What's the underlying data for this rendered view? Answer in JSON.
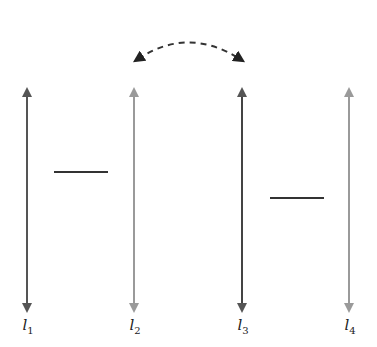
{
  "diagram": {
    "lines": [
      {
        "id": "l1",
        "label": "l",
        "sub": "1",
        "x": 27,
        "color": "#555555"
      },
      {
        "id": "l2",
        "label": "l",
        "sub": "2",
        "x": 134,
        "color": "#9a9a9a"
      },
      {
        "id": "l3",
        "label": "l",
        "sub": "3",
        "x": 242,
        "color": "#444444"
      },
      {
        "id": "l4",
        "label": "l",
        "sub": "4",
        "x": 349,
        "color": "#9a9a9a"
      }
    ],
    "segments": [
      {
        "x1": 54,
        "x2": 108,
        "y": 172
      },
      {
        "x1": 270,
        "x2": 324,
        "y": 198
      }
    ],
    "swap_arrow": {
      "from": "l2",
      "to": "l3",
      "style": "dashed"
    }
  }
}
